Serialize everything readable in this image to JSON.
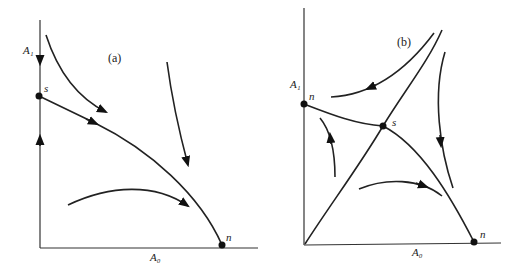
{
  "panels": [
    {
      "id": "a",
      "tag": "(a)",
      "y_axis_label": "A₁",
      "x_axis_label": "A₀",
      "points": [
        {
          "name": "s",
          "label": "s",
          "type": "saddle",
          "on": "A1-axis"
        },
        {
          "name": "n",
          "label": "n",
          "type": "node",
          "on": "A0-axis"
        }
      ],
      "description": "Phase portrait: separatrix from saddle s on A1 axis to stable node n on A0 axis; flow arrows converge toward the separatrix"
    },
    {
      "id": "b",
      "tag": "(b)",
      "y_axis_label": "A₁",
      "x_axis_label": "A₀",
      "points": [
        {
          "name": "n-top",
          "label": "n",
          "type": "node",
          "on": "A1-axis"
        },
        {
          "name": "s",
          "label": "s",
          "type": "saddle",
          "on": "interior"
        },
        {
          "name": "n-right",
          "label": "n",
          "type": "node",
          "on": "A0-axis"
        }
      ],
      "description": "Phase portrait: interior saddle s with separatrices to two nodes on axes and a diagonal separatrix from origin; flow arrows in four regions"
    }
  ]
}
